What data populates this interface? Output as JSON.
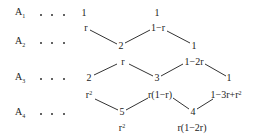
{
  "rows": [
    {
      "label": "A",
      "sub": "1",
      "y": 13
    },
    {
      "label": "A",
      "sub": "2",
      "y": 42
    },
    {
      "label": "A",
      "sub": "3",
      "y": 78
    },
    {
      "label": "A",
      "sub": "4",
      "y": 113
    }
  ],
  "row_dots": ". . .",
  "nodes": {
    "a1_left": "1",
    "a1_right": "1",
    "w_r_1": "r",
    "w_1mr": "1−r",
    "a2_left": "2",
    "a2_right": "1",
    "w_r_2": "r",
    "w_1m2r": "1−2r",
    "a3_left": "2",
    "a3_mid": "3",
    "a3_right": "1",
    "w_r2_base": "r",
    "w_r2_exp": "2",
    "w_r1mr": "r(1−r)",
    "w_poly_base": "1−3r+r",
    "w_poly_exp": "2",
    "a4_left": "5",
    "a4_right": "4",
    "w_r2b_base": "r",
    "w_r2b_exp": "2",
    "w_r1m2r": "r(1−2r)"
  },
  "edges": [
    {
      "from": "r (A1)",
      "to": "2 (A2)"
    },
    {
      "from": "2 (A2)",
      "to": "1−r"
    },
    {
      "from": "1−r",
      "to": "1 (A2)"
    },
    {
      "from": "2 (A3)",
      "to": "r (A2)"
    },
    {
      "from": "r (A2)",
      "to": "3 (A3)"
    },
    {
      "from": "3 (A3)",
      "to": "1−2r"
    },
    {
      "from": "1−2r",
      "to": "1 (A3)"
    },
    {
      "from": "r²",
      "to": "5 (A4)"
    },
    {
      "from": "5 (A4)",
      "to": "r(1−r)"
    },
    {
      "from": "r(1−r)",
      "to": "4 (A4)"
    },
    {
      "from": "4 (A4)",
      "to": "1−3r+r²"
    }
  ]
}
